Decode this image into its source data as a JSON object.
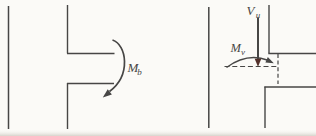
{
  "figure": {
    "colors": {
      "background": "#fbfaf7",
      "ink": "#474645",
      "shear_arrow": "#53302a",
      "shade": "#d8d4cc"
    },
    "left_diagram": {
      "moment_label": {
        "base": "M",
        "sub": "b"
      }
    },
    "right_diagram": {
      "shear_label": {
        "base": "V",
        "sub": "u"
      },
      "moment_label": {
        "base": "M",
        "sub": "v"
      }
    }
  }
}
